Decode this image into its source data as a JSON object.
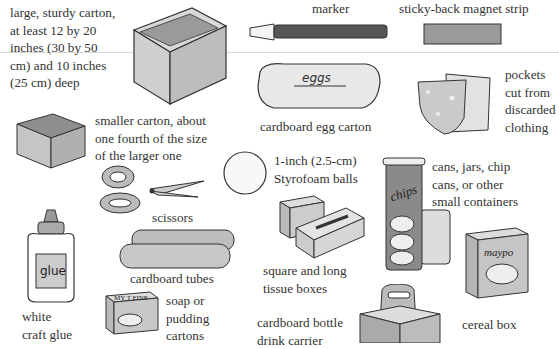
{
  "items": [
    {
      "id": "large-carton",
      "label": "large, sturdy carton,\nat least 12 by 20\ninches (30 by 50\ncm) and 10 inches\n(25 cm) deep"
    },
    {
      "id": "marker",
      "label": "marker"
    },
    {
      "id": "magnet-strip",
      "label": "sticky-back magnet strip"
    },
    {
      "id": "egg-carton",
      "label": "cardboard egg carton",
      "art_text": "eggs"
    },
    {
      "id": "pockets",
      "label": "pockets\ncut from\ndiscarded\nclothing"
    },
    {
      "id": "smaller-carton",
      "label": "smaller carton, about\none fourth of the size\nof the larger one"
    },
    {
      "id": "styrofoam-balls",
      "label": "1-inch (2.5-cm)\nStyrofoam balls"
    },
    {
      "id": "containers",
      "label": "cans, jars, chip\ncans, or other\nsmall containers",
      "art_text": "chips"
    },
    {
      "id": "scissors",
      "label": "scissors"
    },
    {
      "id": "glue",
      "label": "white\ncraft glue",
      "art_text": "glue"
    },
    {
      "id": "tissue-boxes",
      "label": "square and long\ntissue boxes"
    },
    {
      "id": "cardboard-tubes",
      "label": "cardboard tubes"
    },
    {
      "id": "cereal-box",
      "label": "cereal box",
      "art_text": "maypo"
    },
    {
      "id": "soap-cartons",
      "label": "soap or\npudding\ncartons",
      "art_text": "MY T FINE"
    },
    {
      "id": "bottle-carrier",
      "label": "cardboard bottle\ndrink carrier"
    }
  ],
  "colors": {
    "ink": "#333333",
    "fill": "#c8c8c8",
    "dark": "#6e6e6e",
    "light": "#e6e6e6"
  }
}
